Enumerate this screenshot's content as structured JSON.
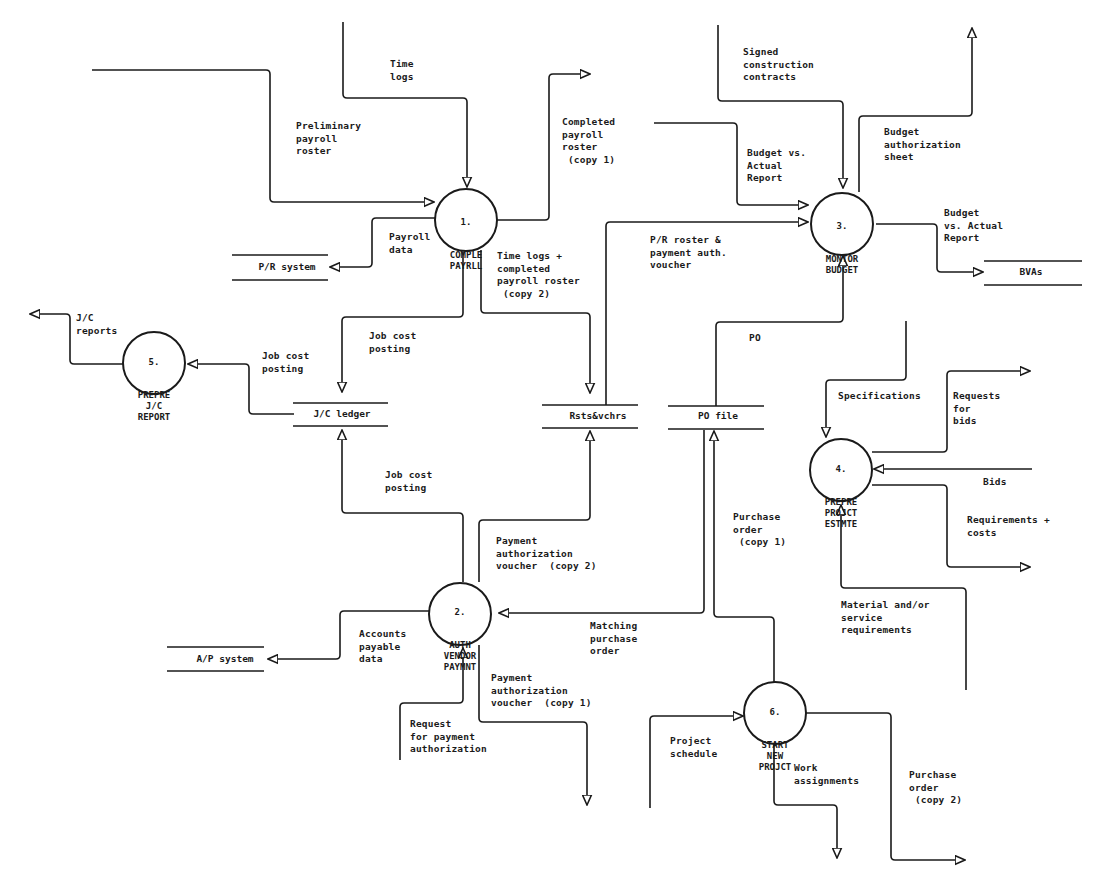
{
  "diagram": {
    "type": "data-flow-diagram",
    "processes": [
      {
        "id": "1",
        "number": "1.",
        "name": "COMPLE\nPAYRLL"
      },
      {
        "id": "2",
        "number": "2.",
        "name": "AUTH\nVENDOR\nPAYMNT"
      },
      {
        "id": "3",
        "number": "3.",
        "name": "MONTOR\nBUDGET"
      },
      {
        "id": "4",
        "number": "4.",
        "name": "PREPRE\nPROJCT\nESTMTE"
      },
      {
        "id": "5",
        "number": "5.",
        "name": "PREPRE\nJ/C\nREPORT"
      },
      {
        "id": "6",
        "number": "6.",
        "name": "START\nNEW\nPROJCT"
      }
    ],
    "data_stores": [
      {
        "id": "pr_system",
        "label": "P/R system"
      },
      {
        "id": "jc_ledger",
        "label": "J/C ledger"
      },
      {
        "id": "rsts_vchrs",
        "label": "Rsts&vchrs"
      },
      {
        "id": "po_file",
        "label": "PO file"
      },
      {
        "id": "bvas",
        "label": "BVAs"
      },
      {
        "id": "ap_system",
        "label": "A/P system"
      }
    ],
    "flows": {
      "time_logs": "Time\nlogs",
      "preliminary_payroll_roster": "Preliminary\npayroll\nroster",
      "completed_payroll_roster_copy1": "Completed\npayroll\nroster\n (copy 1)",
      "payroll_data": "Payroll\ndata",
      "time_logs_completed_roster_copy2": "Time logs +\ncompleted\npayroll roster\n (copy 2)",
      "signed_construction_contracts": "Signed\nconstruction\ncontracts",
      "budget_vs_actual_report_in": "Budget vs.\nActual\nReport",
      "budget_authorization_sheet": "Budget\nauthorization\nsheet",
      "budget_vs_actual_report_out": "Budget\nvs. Actual\nReport",
      "pr_roster_payment_voucher": "P/R roster &\npayment auth.\nvoucher",
      "po": "PO",
      "jc_reports": "J/C\nreports",
      "job_cost_posting_to_report": "Job cost\nposting",
      "job_cost_posting_from_payroll": "Job cost\nposting",
      "job_cost_posting_from_ap": "Job cost\nposting",
      "specifications": "Specifications",
      "requests_for_bids": "Requests\nfor\nbids",
      "bids": "Bids",
      "requirements_costs": "Requirements +\ncosts",
      "purchase_order_copy1": "Purchase\norder\n (copy 1)",
      "payment_authorization_voucher_copy2": "Payment\nauthorization\nvoucher  (copy 2)",
      "matching_purchase_order": "Matching\npurchase\norder",
      "accounts_payable_data": "Accounts\npayable\ndata",
      "material_service_requirements": "Material and/or\nservice\nrequirements",
      "payment_authorization_voucher_copy1": "Payment\nauthorization\nvoucher  (copy 1)",
      "request_for_payment_authorization": "Request\nfor payment\nauthorization",
      "project_schedule": "Project\nschedule",
      "work_assignments": "Work\nassignments",
      "purchase_order_copy2": "Purchase\norder\n (copy 2)"
    }
  }
}
